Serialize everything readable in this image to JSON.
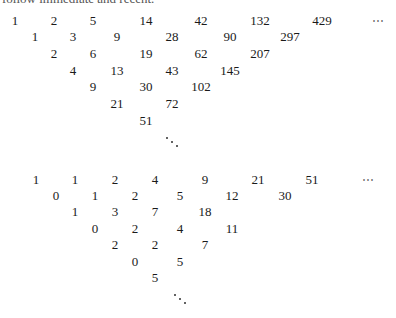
{
  "header": {
    "cut_off_text": "follow immediate and recent."
  },
  "triangle_top": {
    "rows": [
      [
        "1",
        "2",
        "5",
        "14",
        "42",
        "132",
        "429"
      ],
      [
        "1",
        "3",
        "9",
        "28",
        "90",
        "297"
      ],
      [
        "2",
        "6",
        "19",
        "62",
        "207"
      ],
      [
        "4",
        "13",
        "43",
        "145"
      ],
      [
        "9",
        "30",
        "102"
      ],
      [
        "21",
        "72"
      ],
      [
        "51"
      ]
    ],
    "row_continuation": "⋯",
    "diag_continuation": "⋱"
  },
  "triangle_bottom": {
    "rows": [
      [
        "1",
        "1",
        "2",
        "4",
        "9",
        "21",
        "51"
      ],
      [
        "0",
        "1",
        "2",
        "5",
        "12",
        "30"
      ],
      [
        "1",
        "3",
        "7",
        "18"
      ],
      [
        "0",
        "2",
        "4",
        "11"
      ],
      [
        "2",
        "2",
        "7"
      ],
      [
        "0",
        "5"
      ],
      [
        "5"
      ]
    ],
    "row_continuation": "⋯",
    "diag_continuation": "⋱"
  }
}
